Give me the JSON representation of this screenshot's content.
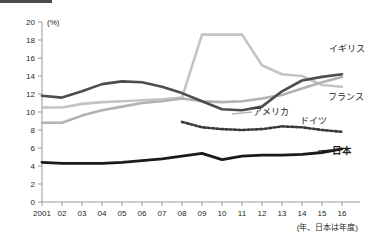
{
  "title": {
    "text": "",
    "note": "title-cropped-at-top-edge"
  },
  "axis": {
    "y_unit": "(%)",
    "y_ticks": [
      "0",
      "2",
      "4",
      "6",
      "8",
      "10",
      "12",
      "14",
      "16",
      "18",
      "20"
    ],
    "x_ticks": [
      "2001",
      "02",
      "03",
      "04",
      "05",
      "06",
      "07",
      "08",
      "09",
      "10",
      "11",
      "12",
      "13",
      "14",
      "15",
      "16"
    ],
    "x_footnote": "(年、日本は年度)"
  },
  "labels": {
    "uk": "イギリス",
    "france": "フランス",
    "usa": "アメリカ",
    "germany": "ドイツ",
    "japan": "日本"
  },
  "colors": {
    "uk": "#4d4d4d",
    "france": "#c4c4c4",
    "germany": "#b2b2b2",
    "usa": "#3a3a3a",
    "japan": "#1a1a1a",
    "axis": "#9a9a9a",
    "background": "#ffffff"
  },
  "chart_data": {
    "type": "line",
    "title": "",
    "xlabel": "(年、日本は年度)",
    "ylabel": "(%)",
    "xlim": [
      2001,
      2016
    ],
    "ylim": [
      0,
      20
    ],
    "ytick_step": 2,
    "grid": false,
    "legend": "inline-labels-at-line-ends",
    "x": [
      2001,
      2002,
      2003,
      2004,
      2005,
      2006,
      2007,
      2008,
      2009,
      2010,
      2011,
      2012,
      2013,
      2014,
      2015,
      2016
    ],
    "series": [
      {
        "name": "イギリス",
        "style": "solid-dark-gray",
        "values": [
          11.8,
          11.6,
          12.3,
          13.1,
          13.4,
          13.3,
          12.8,
          12.1,
          11.2,
          10.3,
          10.2,
          10.6,
          12.3,
          13.5,
          13.9,
          14.2
        ]
      },
      {
        "name": "フランス",
        "style": "solid-light-gray",
        "values": [
          10.5,
          10.5,
          10.9,
          11.1,
          11.2,
          11.3,
          11.4,
          11.6,
          18.6,
          18.6,
          18.6,
          15.2,
          14.2,
          14.0,
          13.0,
          12.8
        ]
      },
      {
        "name": "ドイツ",
        "style": "solid-light-gray",
        "values": [
          8.8,
          8.8,
          9.6,
          10.2,
          10.6,
          11.0,
          11.2,
          11.5,
          11.2,
          11.1,
          11.2,
          11.5,
          11.9,
          12.6,
          13.3,
          13.9
        ]
      },
      {
        "name": "アメリカ",
        "style": "dotted-dark",
        "values": [
          null,
          null,
          null,
          null,
          null,
          null,
          null,
          8.9,
          8.3,
          8.1,
          8.0,
          8.1,
          8.4,
          8.3,
          8.0,
          7.8
        ]
      },
      {
        "name": "日本",
        "style": "solid-black-bold",
        "values": [
          4.4,
          4.3,
          4.3,
          4.3,
          4.4,
          4.6,
          4.8,
          5.1,
          5.4,
          4.7,
          5.1,
          5.2,
          5.2,
          5.3,
          5.5,
          5.9
        ]
      }
    ]
  }
}
